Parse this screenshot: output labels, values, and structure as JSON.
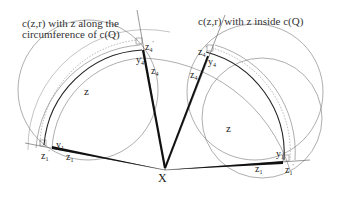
{
  "captions": {
    "left": [
      "c(z,r) with z along the",
      "circumference of c(Q)"
    ],
    "right": "c(z,r) with z inside c(Q)"
  },
  "labels": {
    "X": "X",
    "z_left": "z",
    "z_right": "z",
    "left_top": {
      "zprime": "z",
      "zprime_sub": "4",
      "zprime_sup": "'",
      "y": "y",
      "y_sub": "4",
      "z": "z",
      "z_sub": "4"
    },
    "left_bottom": {
      "zprime": "z",
      "zprime_sub": "1",
      "zprime_sup": "'",
      "y": "y",
      "y_sub": "1",
      "z": "z",
      "z_sub": "1"
    },
    "right_top": {
      "zprime": "z",
      "zprime_sub": "4",
      "zprime_sup": "'",
      "y": "y",
      "y_sub": "4",
      "z": "z",
      "z_sub": "4"
    },
    "right_bottom": {
      "zprime": "z",
      "zprime_sub": "1",
      "zprime_sup": "'",
      "y": "y",
      "y_sub": "1",
      "z": "z",
      "z_sub": "1"
    }
  },
  "colors": {
    "stroke": "#555555",
    "thick": "#111111",
    "text": "#222222"
  }
}
